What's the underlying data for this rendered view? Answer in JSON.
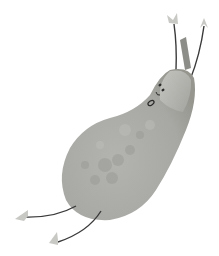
{
  "illustration": {
    "subject": "pear character",
    "description": "Watercolor-style gray pear with stick arms and legs, leaf-shaped hands and feet, and a small surprised face",
    "colors": {
      "background": "#ffffff",
      "pear_body": "#a9a9a5",
      "pear_highlight": "#c9c9c5",
      "pear_shadow": "#8f8f8b",
      "stem": "#8c8c88",
      "limbs": "#3a3a3a",
      "hands_feet": "#c8c8c4",
      "face": "#2a2a2a"
    }
  }
}
